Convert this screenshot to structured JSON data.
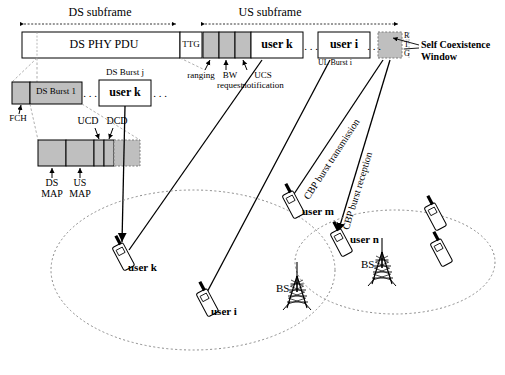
{
  "figure": {
    "type": "network-frame-structure-diagram",
    "topic": "IEEE 802.22 / WiMAX DS-US frame structure with self-coexistence window and CBP bursts"
  },
  "frame": {
    "ds_subframe_label": "DS subframe",
    "us_subframe_label": "US subframe",
    "ds_phy_pdu": "DS PHY PDU",
    "ttg": "TTG",
    "scw_letters": [
      "R",
      "T",
      "G"
    ],
    "self_coexistence_window": "Self Coexistence\nWindow",
    "self_coexistence_window_line1": "Self Coexistence",
    "self_coexistence_window_line2": "Window"
  },
  "us_annotations": {
    "ranging": "ranging",
    "bw_request_line1": "BW",
    "bw_request_line2": "request",
    "ucs_line1": "UCS",
    "ucs_line2": "notification",
    "user_k": "user k",
    "user_i": "user i",
    "ellipsis": ". . .",
    "ul_burst": "UL Burst i"
  },
  "ds_detail": {
    "fch": "FCH",
    "ds_burst_1": "DS Burst 1",
    "ds_burst_j": "DS Burst j",
    "user_k": "user k",
    "ellipsis": ". . .",
    "ucd": "UCD",
    "dcd": "DCD",
    "ds_map_line1": "DS",
    "ds_map_line2": "MAP",
    "us_map_line1": "US",
    "us_map_line2": "MAP"
  },
  "cbp": {
    "transmission": "CBP burst transmission",
    "reception": "CBP burst reception"
  },
  "cells": {
    "left": {
      "bs": "BS",
      "users": [
        "user k",
        "user i",
        "user m"
      ]
    },
    "right": {
      "bs": "BS",
      "users": [
        "user n"
      ]
    }
  },
  "colors": {
    "line": "#000000",
    "fill_gray": "#bfbfbf",
    "dash_gray": "#8a8a8a",
    "white": "#ffffff"
  }
}
